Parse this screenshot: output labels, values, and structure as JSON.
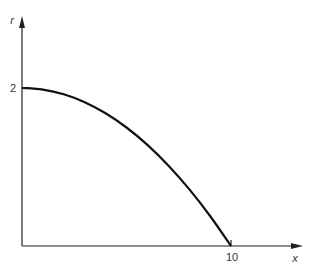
{
  "chart_data": {
    "type": "line",
    "title": "",
    "xlabel": "x",
    "ylabel": "r",
    "x_ticks": [
      {
        "value": 10,
        "label": "10"
      }
    ],
    "y_ticks": [
      {
        "value": 2,
        "label": "2"
      }
    ],
    "xlim": [
      0,
      13.5
    ],
    "ylim": [
      0,
      2.9
    ],
    "grid": false,
    "legend": null,
    "series": [
      {
        "name": "r(x)",
        "description": "parabolic profile r = 2(1 - x^2/100)",
        "x": [
          0,
          1,
          2,
          3,
          4,
          5,
          6,
          7,
          8,
          9,
          10
        ],
        "values": [
          2.0,
          1.98,
          1.92,
          1.82,
          1.68,
          1.5,
          1.28,
          1.02,
          0.72,
          0.38,
          0.0
        ]
      }
    ]
  },
  "labels": {
    "y_axis": "r",
    "x_axis": "x",
    "y_tick": "2",
    "x_tick": "10"
  }
}
